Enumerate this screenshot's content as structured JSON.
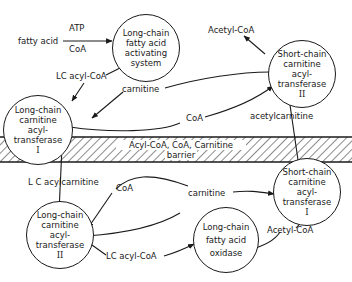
{
  "membrane": {
    "line1": "Acyl-CoA, CoA, Carnitine",
    "line2": "barrier"
  },
  "nodes": {
    "lc_activating": {
      "l1": "Long-chain",
      "l2": "fatty acid",
      "l3": "activating",
      "l4": "system"
    },
    "lc_cat1": {
      "l1": "Long-chain",
      "l2": "carnitine",
      "l3": "acyl-",
      "l4": "transferase",
      "l5": "I"
    },
    "sc_cat2": {
      "l1": "Short-chain",
      "l2": "carnitine",
      "l3": "acyl-",
      "l4": "transferase",
      "l5": "II"
    },
    "sc_cat1": {
      "l1": "Short-chain",
      "l2": "carnitine",
      "l3": "acyl-",
      "l4": "transferase",
      "l5": "I"
    },
    "lc_cat2": {
      "l1": "Long-chain",
      "l2": "carnitine",
      "l3": "acyl-",
      "l4": "transferase",
      "l5": "II"
    },
    "lc_oxidase": {
      "l1": "Long-chain",
      "l2": "fatty acid",
      "l3": "oxidase"
    }
  },
  "labels": {
    "atp": "ATP",
    "fatty_acid": "fatty acid",
    "coa_top": "CoA",
    "lc_acyl_coa_top": "LC acyl-CoA",
    "carnitine_top": "carnitine",
    "coa_mid_top": "CoA",
    "acetyl_coa_top": "Acetyl-CoA",
    "acetylcarnitine": "acetylcarnitine",
    "lc_acylcarnitine": "L C acylcarnitine",
    "coa_bottom": "CoA",
    "carnitine_bottom": "carnitine",
    "lc_acyl_coa_bottom": "LC acyl-CoA",
    "acetyl_coa_bottom": "Acetyl-CoA"
  },
  "colors": {
    "ink": "#1a1a1a",
    "background": "#ffffff"
  }
}
